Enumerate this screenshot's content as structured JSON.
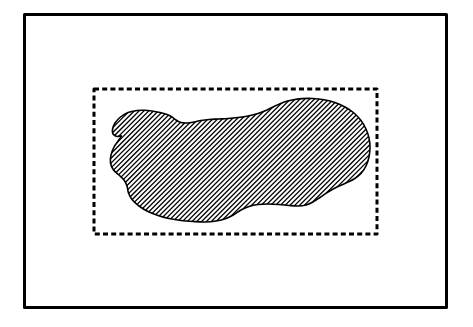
{
  "figure": {
    "type": "scatter-with-region-overlay",
    "caption": "",
    "background_color": "#ffffff",
    "ink_color": "#000000",
    "noise_color": "#1a1a1a",
    "width": 473,
    "height": 327
  },
  "outer_frame": {
    "label": "image-border",
    "shape": "rectangle",
    "stroke_color": "#000000",
    "stroke_width": 3,
    "x": 23,
    "y": 13,
    "width": 425,
    "height": 296,
    "style": "solid"
  },
  "bounding_box": {
    "label": "dashed-bounding-box",
    "shape": "rectangle",
    "stroke_color": "#000000",
    "stroke_width": 3,
    "style": "dashed",
    "dash_length": 5,
    "gap_length": 3.2,
    "x": 94,
    "y": 89,
    "width": 283,
    "height": 145
  },
  "region": {
    "label": "hatched-region",
    "shape": "closed-freeform-blob",
    "outline_color": "#000000",
    "outline_width": 1.6,
    "fill_pattern": "diagonal-hatch",
    "hatch_angle_deg": 45,
    "hatch_spacing_px": 3.4,
    "hatch_line_width": 1.3,
    "hatch_color": "#000000",
    "bounds": {
      "x": 110,
      "y": 98,
      "width": 260,
      "height": 126
    },
    "outline_points": [
      [
        137.0,
        110.5
      ],
      [
        128.0,
        112.5
      ],
      [
        120.5,
        117.0
      ],
      [
        115.0,
        123.0
      ],
      [
        112.5,
        129.5
      ],
      [
        113.0,
        134.0
      ],
      [
        117.0,
        136.5
      ],
      [
        121.5,
        136.0
      ],
      [
        118.5,
        140.5
      ],
      [
        114.0,
        147.0
      ],
      [
        111.0,
        155.0
      ],
      [
        110.5,
        163.0
      ],
      [
        113.5,
        170.0
      ],
      [
        119.0,
        175.0
      ],
      [
        124.0,
        180.0
      ],
      [
        127.0,
        186.0
      ],
      [
        128.5,
        193.0
      ],
      [
        132.0,
        199.5
      ],
      [
        139.0,
        206.0
      ],
      [
        148.0,
        211.5
      ],
      [
        158.0,
        215.5
      ],
      [
        169.0,
        218.5
      ],
      [
        181.0,
        220.5
      ],
      [
        193.0,
        221.5
      ],
      [
        205.0,
        222.0
      ],
      [
        216.0,
        221.0
      ],
      [
        226.0,
        218.5
      ],
      [
        234.0,
        214.5
      ],
      [
        241.0,
        210.0
      ],
      [
        249.0,
        206.5
      ],
      [
        258.0,
        204.5
      ],
      [
        268.0,
        204.0
      ],
      [
        279.0,
        204.5
      ],
      [
        289.0,
        205.5
      ],
      [
        298.0,
        206.0
      ],
      [
        306.0,
        205.0
      ],
      [
        313.0,
        202.0
      ],
      [
        320.0,
        197.5
      ],
      [
        328.0,
        192.0
      ],
      [
        337.0,
        187.0
      ],
      [
        346.0,
        183.0
      ],
      [
        354.0,
        179.0
      ],
      [
        361.0,
        173.5
      ],
      [
        366.0,
        166.0
      ],
      [
        369.0,
        157.0
      ],
      [
        370.0,
        147.5
      ],
      [
        369.0,
        138.0
      ],
      [
        366.0,
        129.0
      ],
      [
        361.0,
        120.5
      ],
      [
        354.0,
        113.0
      ],
      [
        345.0,
        107.0
      ],
      [
        335.0,
        102.5
      ],
      [
        324.0,
        99.8
      ],
      [
        313.0,
        98.5
      ],
      [
        302.0,
        98.6
      ],
      [
        292.0,
        100.0
      ],
      [
        283.0,
        102.5
      ],
      [
        275.0,
        106.0
      ],
      [
        267.0,
        110.0
      ],
      [
        258.0,
        113.5
      ],
      [
        248.0,
        116.0
      ],
      [
        238.0,
        117.5
      ],
      [
        228.0,
        118.5
      ],
      [
        218.0,
        119.0
      ],
      [
        209.0,
        119.5
      ],
      [
        201.0,
        120.5
      ],
      [
        194.0,
        122.0
      ],
      [
        187.0,
        123.0
      ],
      [
        181.0,
        122.5
      ],
      [
        176.0,
        120.0
      ],
      [
        172.0,
        117.0
      ],
      [
        167.0,
        114.5
      ],
      [
        160.0,
        112.5
      ],
      [
        152.0,
        111.0
      ],
      [
        144.0,
        110.3
      ]
    ]
  },
  "noise_cloud": {
    "label": "speckle-point-cloud",
    "description": "dense speckle concentrated along the region boundary, thinning outward to sparse dots across the whole frame",
    "point_size_px": 1,
    "dense_band_width_px": 26,
    "seed": 20240617,
    "dense_points": 5200,
    "mid_points": 1500,
    "sparse_points": 900
  }
}
